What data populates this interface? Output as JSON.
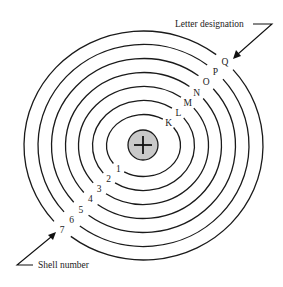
{
  "diagram": {
    "nucleus": {
      "symbol": "+"
    },
    "shells": [
      {
        "number": "1",
        "letter": "K"
      },
      {
        "number": "2",
        "letter": "L"
      },
      {
        "number": "3",
        "letter": "M"
      },
      {
        "number": "4",
        "letter": "N"
      },
      {
        "number": "5",
        "letter": "O"
      },
      {
        "number": "6",
        "letter": "P"
      },
      {
        "number": "7",
        "letter": "Q"
      }
    ],
    "captions": {
      "letter_designation": "Letter designation",
      "shell_number": "Shell number"
    },
    "colors": {
      "line": "#1a1a1a",
      "nucleus_fill": "#c9c9c9",
      "background": "#ffffff"
    }
  }
}
